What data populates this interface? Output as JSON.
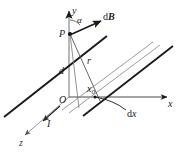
{
  "figure": {
    "background_color": "#ffffff",
    "ink_color": "#1a1a1a",
    "faint_ink_color": "#6e6e6e",
    "width": 181,
    "height": 160
  },
  "axes": {
    "y": {
      "label": "y",
      "arrow": "up",
      "origin_px": [
        69,
        97
      ],
      "tip_px": [
        69,
        8
      ]
    },
    "x": {
      "label": "x",
      "arrow": "right",
      "origin_px": [
        69,
        97
      ],
      "tip_px": [
        171,
        97
      ]
    },
    "z": {
      "label": "z",
      "arrow": "down-left",
      "origin_px": [
        69,
        97
      ],
      "tip_px": [
        22,
        138
      ]
    },
    "origin": {
      "label": "O",
      "px": [
        62,
        100
      ]
    }
  },
  "points": {
    "P": {
      "label": "P",
      "px": [
        69,
        32
      ],
      "description": "field point on the y-axis"
    },
    "x0": {
      "label": "x",
      "subscript": "0",
      "px": [
        91,
        92
      ],
      "description": "position of the current element on the x-axis"
    }
  },
  "vectors": {
    "dB": {
      "head": "d",
      "symbol": "B",
      "label": "dB",
      "bold": true,
      "from_px": [
        72,
        33
      ],
      "to_px": [
        105,
        19
      ],
      "description": "magnetic field contribution at P"
    },
    "current": {
      "label": "I",
      "italic": true,
      "direction": "along z, toward viewer-left",
      "px": [
        50,
        124
      ]
    }
  },
  "lengths": {
    "d": {
      "label": "d",
      "px": [
        61,
        70
      ],
      "description": "perpendicular distance from the sheet plane to P"
    },
    "r": {
      "label": "r",
      "px": [
        88,
        62
      ],
      "description": "distance from the current element to P"
    }
  },
  "angles": {
    "alpha": {
      "label": "α",
      "px": [
        78,
        17
      ],
      "description": "angle between dB and the y-axis"
    }
  },
  "elements": {
    "dx": {
      "head": "d",
      "symbol": "x",
      "label": "dx",
      "px": [
        131,
        113
      ],
      "description": "differential width of the current strip"
    }
  },
  "geometry": {
    "main_conductor_line": {
      "from_px": [
        4,
        117
      ],
      "to_px": [
        107,
        36
      ],
      "width": 2.0,
      "color": "#1a1a1a"
    },
    "strip_edge_a": {
      "from_px": [
        62,
        110
      ],
      "to_px": [
        153,
        42
      ],
      "width": 0.8,
      "color": "#8a8a8a"
    },
    "strip_edge_b": {
      "from_px": [
        69,
        113
      ],
      "to_px": [
        159,
        45
      ],
      "width": 0.8,
      "color": "#8a8a8a"
    },
    "strip_dark_line": {
      "from_px": [
        83,
        115
      ],
      "to_px": [
        172,
        46
      ],
      "width": 1.8,
      "color": "#1a1a1a"
    },
    "r_line": {
      "from_px": [
        70,
        34
      ],
      "to_px": [
        100,
        100
      ],
      "width": 0.8,
      "color": "#4a4a4a"
    },
    "p_drop_line": {
      "from_px": [
        70,
        34
      ],
      "to_px": [
        78,
        106
      ],
      "width": 0.8,
      "color": "#6e6e6e"
    },
    "dx_leader_arc": {
      "from_px": [
        96,
        97
      ],
      "to_px": [
        127,
        110
      ],
      "color": "#1a1a1a"
    }
  }
}
